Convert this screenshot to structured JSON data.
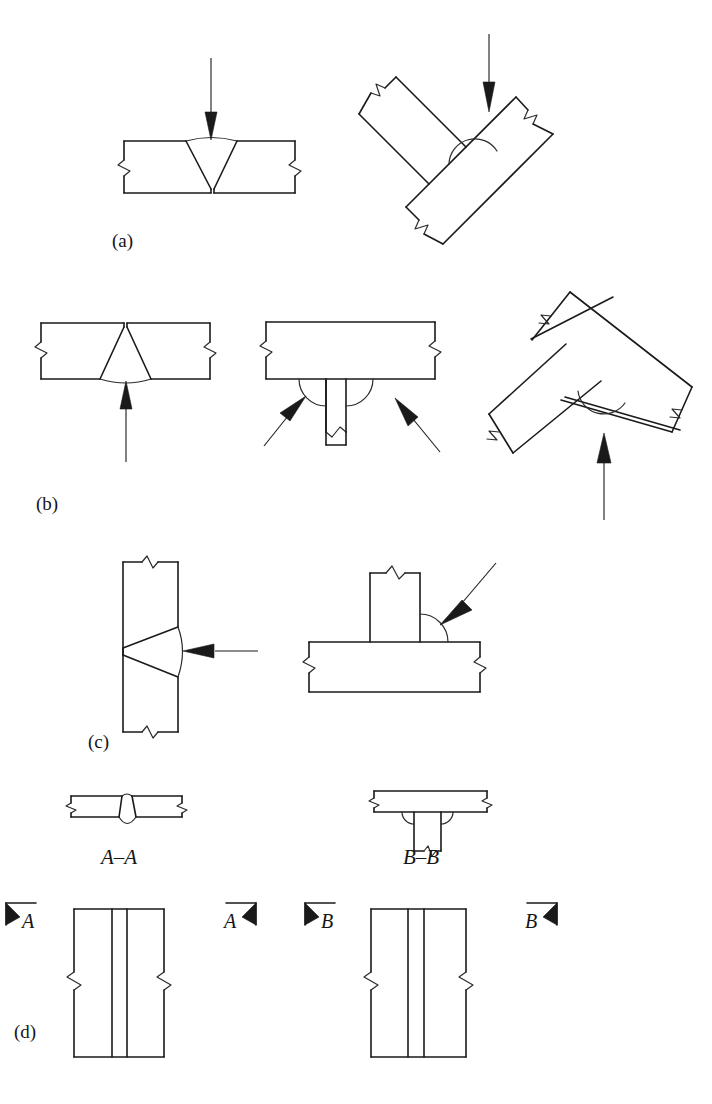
{
  "figure": {
    "background_color": "#ffffff",
    "line_color": "#1a1a1a",
    "fill_color": "#1a1a1a"
  },
  "row_labels": {
    "a": "(a)",
    "b": "(b)",
    "c": "(c)",
    "d": "(d)"
  },
  "section_labels": {
    "a_a": "A–A",
    "b_b": "B–B"
  },
  "section_markers": [
    {
      "label": "A",
      "side": "left"
    },
    {
      "label": "A",
      "side": "right"
    },
    {
      "label": "B",
      "side": "left"
    },
    {
      "label": "B",
      "side": "right"
    }
  ],
  "panels": [
    {
      "id": "a-left",
      "row": "a",
      "joint": "butt-joint-plate",
      "weld": "single-v-groove",
      "weld_side": "top",
      "arrow_direction": "down",
      "arrow_count": 1
    },
    {
      "id": "a-right",
      "row": "a",
      "joint": "tee-joint-rotated",
      "weld": "fillet",
      "weld_side": "upper",
      "arrow_direction": "down",
      "arrow_count": 1
    },
    {
      "id": "b-left",
      "row": "b",
      "joint": "butt-joint-plate",
      "weld": "single-v-groove",
      "weld_side": "bottom",
      "arrow_direction": "up",
      "arrow_count": 1
    },
    {
      "id": "b-middle",
      "row": "b",
      "joint": "tee-joint",
      "weld": "double-fillet",
      "weld_side": "both",
      "arrow_direction": "diagonal",
      "arrow_count": 2
    },
    {
      "id": "b-right",
      "row": "b",
      "joint": "tee-joint-rotated",
      "weld": "fillet",
      "weld_side": "lower",
      "arrow_direction": "up",
      "arrow_count": 1
    },
    {
      "id": "c-left",
      "row": "c",
      "joint": "butt-joint-plate-vertical",
      "weld": "single-v-groove",
      "weld_side": "right",
      "arrow_direction": "left",
      "arrow_count": 1
    },
    {
      "id": "c-right",
      "row": "c",
      "joint": "tee-joint",
      "weld": "fillet",
      "weld_side": "right",
      "arrow_direction": "down-left",
      "arrow_count": 1
    },
    {
      "id": "d-left",
      "row": "d",
      "joint": "butt-joint-plan-view",
      "weld": "seam",
      "section": "A–A"
    },
    {
      "id": "d-right",
      "row": "d",
      "joint": "tee-joint-plan-view",
      "weld": "seam",
      "section": "B–B"
    }
  ],
  "section_views": [
    {
      "id": "a-a-view",
      "label": "A–A",
      "joint": "butt-joint",
      "weld": "single-v-groove-with-root-reinforcement"
    },
    {
      "id": "b-b-view",
      "label": "B–B",
      "joint": "tee-joint",
      "weld": "double-fillet"
    }
  ]
}
